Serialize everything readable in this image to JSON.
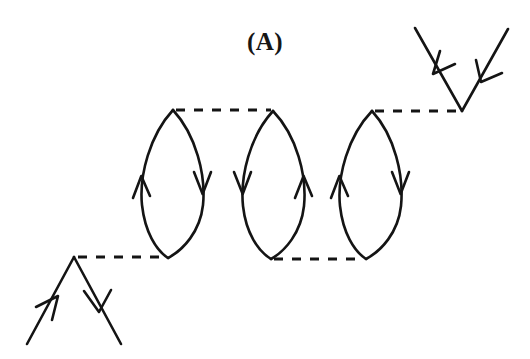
{
  "figure": {
    "panel_label": "(A)",
    "width": 530,
    "height": 359,
    "background_color": "#ffffff",
    "line_color": "#141414"
  },
  "elements": {
    "loops": [
      {
        "name": "bubble-loop-1",
        "top_vertex": {
          "x": 173,
          "y": 110
        },
        "bottom_vertex": {
          "x": 168,
          "y": 258
        },
        "left_arc_direction": "up",
        "right_arc_direction": "down",
        "left_arrow": {
          "x": 141,
          "y": 184
        },
        "right_arrow": {
          "x": 192,
          "y": 184
        },
        "bulge": 34
      },
      {
        "name": "bubble-loop-2",
        "top_vertex": {
          "x": 273,
          "y": 111
        },
        "bottom_vertex": {
          "x": 271,
          "y": 259
        },
        "left_arc_direction": "down",
        "right_arc_direction": "up",
        "left_arrow": {
          "x": 243,
          "y": 184
        },
        "right_arrow": {
          "x": 296,
          "y": 184
        },
        "bulge": 34
      },
      {
        "name": "bubble-loop-3",
        "top_vertex": {
          "x": 372,
          "y": 111
        },
        "bottom_vertex": {
          "x": 366,
          "y": 259
        },
        "left_arc_direction": "up",
        "right_arc_direction": "down",
        "left_arrow": {
          "x": 339,
          "y": 184
        },
        "right_arrow": {
          "x": 390,
          "y": 184
        },
        "bulge": 34
      }
    ],
    "interaction_lines": [
      {
        "name": "interaction-line-bottom-left",
        "from": {
          "x": 78,
          "y": 257
        },
        "to": {
          "x": 166,
          "y": 257
        }
      },
      {
        "name": "interaction-line-top-1-2",
        "from": {
          "x": 176,
          "y": 110
        },
        "to": {
          "x": 271,
          "y": 110
        }
      },
      {
        "name": "interaction-line-bottom-2-3",
        "from": {
          "x": 274,
          "y": 259
        },
        "to": {
          "x": 364,
          "y": 259
        }
      },
      {
        "name": "interaction-line-top-right",
        "from": {
          "x": 375,
          "y": 111
        },
        "to": {
          "x": 462,
          "y": 111
        }
      }
    ],
    "external_legs": [
      {
        "name": "external-leg-incoming-lower-left",
        "from": {
          "x": 27,
          "y": 344
        },
        "to": {
          "x": 74,
          "y": 257
        },
        "arrow_at": {
          "x": 50,
          "y": 301
        },
        "arrow_direction": "up-right",
        "flow": "incoming"
      },
      {
        "name": "external-leg-outgoing-lower-right",
        "from": {
          "x": 74,
          "y": 257
        },
        "to": {
          "x": 121,
          "y": 344
        },
        "arrow_at": {
          "x": 97,
          "y": 300
        },
        "arrow_direction": "down-right",
        "flow": "outgoing"
      },
      {
        "name": "external-leg-outgoing-upper-left",
        "from": {
          "x": 462,
          "y": 111
        },
        "to": {
          "x": 415,
          "y": 28
        },
        "arrow_at": {
          "x": 439,
          "y": 70
        },
        "arrow_direction": "up-left",
        "flow": "outgoing"
      },
      {
        "name": "external-leg-incoming-upper-right",
        "from": {
          "x": 508,
          "y": 29
        },
        "to": {
          "x": 462,
          "y": 111
        },
        "arrow_at": {
          "x": 484,
          "y": 70
        },
        "arrow_direction": "down-left",
        "flow": "incoming"
      }
    ],
    "vertices": [
      {
        "name": "vertex-lower-left",
        "x": 74,
        "y": 257
      },
      {
        "name": "vertex-upper-right",
        "x": 462,
        "y": 111
      }
    ]
  }
}
